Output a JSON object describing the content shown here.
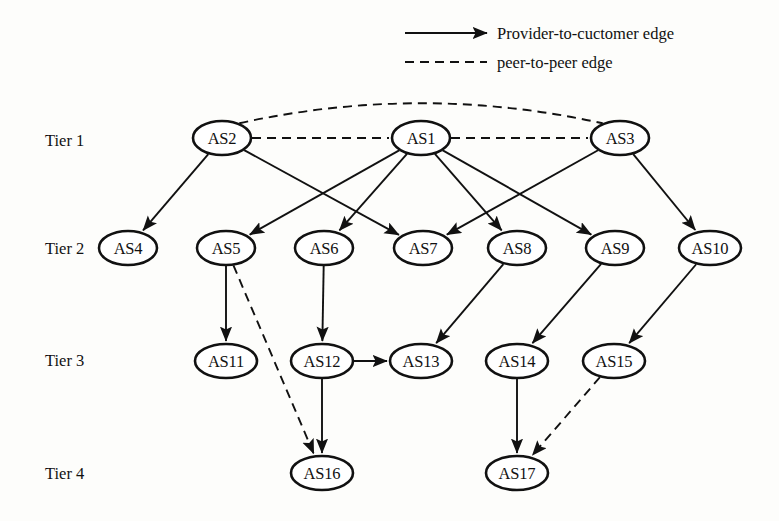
{
  "figure": {
    "kind": "as-hierarchy-diagram",
    "width": 779,
    "height": 521,
    "background_color": "#fdfdfb",
    "ink_color": "#111111"
  },
  "legend": {
    "items": [
      {
        "id": "legend-provider",
        "label": "Provider-to-cuctomer edge",
        "style": "solid-arrow"
      },
      {
        "id": "legend-peer",
        "label": "peer-to-peer edge",
        "style": "dashed"
      }
    ]
  },
  "tiers": [
    {
      "id": "tier-1",
      "label": "Tier 1",
      "x": 45,
      "y": 140
    },
    {
      "id": "tier-2",
      "label": "Tier 2",
      "x": 45,
      "y": 248
    },
    {
      "id": "tier-3",
      "label": "Tier 3",
      "x": 45,
      "y": 360
    },
    {
      "id": "tier-4",
      "label": "Tier 4",
      "x": 45,
      "y": 473
    }
  ],
  "nodes": [
    {
      "id": "AS2",
      "label": "AS2",
      "tier": 1,
      "x": 222,
      "y": 138,
      "rx": 29,
      "ry": 17
    },
    {
      "id": "AS1",
      "label": "AS1",
      "tier": 1,
      "x": 421,
      "y": 138,
      "rx": 29,
      "ry": 17
    },
    {
      "id": "AS3",
      "label": "AS3",
      "tier": 1,
      "x": 620,
      "y": 138,
      "rx": 29,
      "ry": 17
    },
    {
      "id": "AS4",
      "label": "AS4",
      "tier": 2,
      "x": 128,
      "y": 248,
      "rx": 29,
      "ry": 17
    },
    {
      "id": "AS5",
      "label": "AS5",
      "tier": 2,
      "x": 226,
      "y": 248,
      "rx": 29,
      "ry": 17
    },
    {
      "id": "AS6",
      "label": "AS6",
      "tier": 2,
      "x": 324,
      "y": 248,
      "rx": 29,
      "ry": 17
    },
    {
      "id": "AS7",
      "label": "AS7",
      "tier": 2,
      "x": 423,
      "y": 248,
      "rx": 29,
      "ry": 17
    },
    {
      "id": "AS8",
      "label": "AS8",
      "tier": 2,
      "x": 517,
      "y": 248,
      "rx": 29,
      "ry": 17
    },
    {
      "id": "AS9",
      "label": "AS9",
      "tier": 2,
      "x": 615,
      "y": 248,
      "rx": 29,
      "ry": 17
    },
    {
      "id": "AS10",
      "label": "AS10",
      "tier": 2,
      "x": 710,
      "y": 248,
      "rx": 31,
      "ry": 17
    },
    {
      "id": "AS11",
      "label": "AS11",
      "tier": 3,
      "x": 226,
      "y": 361,
      "rx": 31,
      "ry": 17
    },
    {
      "id": "AS12",
      "label": "AS12",
      "tier": 3,
      "x": 322,
      "y": 361,
      "rx": 31,
      "ry": 17
    },
    {
      "id": "AS13",
      "label": "AS13",
      "tier": 3,
      "x": 421,
      "y": 361,
      "rx": 31,
      "ry": 17
    },
    {
      "id": "AS14",
      "label": "AS14",
      "tier": 3,
      "x": 517,
      "y": 361,
      "rx": 31,
      "ry": 17
    },
    {
      "id": "AS15",
      "label": "AS15",
      "tier": 3,
      "x": 614,
      "y": 361,
      "rx": 31,
      "ry": 17
    },
    {
      "id": "AS16",
      "label": "AS16",
      "tier": 4,
      "x": 322,
      "y": 473,
      "rx": 31,
      "ry": 17
    },
    {
      "id": "AS17",
      "label": "AS17",
      "tier": 4,
      "x": 517,
      "y": 473,
      "rx": 31,
      "ry": 17
    }
  ],
  "edges": [
    {
      "id": "AS2-AS3",
      "from": "AS2",
      "to": "AS3",
      "type": "peer",
      "shape": "arc",
      "arc_apex_y": 104
    },
    {
      "id": "AS2-AS1",
      "from": "AS2",
      "to": "AS1",
      "type": "peer",
      "shape": "straight"
    },
    {
      "id": "AS1-AS3",
      "from": "AS1",
      "to": "AS3",
      "type": "peer",
      "shape": "straight"
    },
    {
      "id": "AS2-AS4",
      "from": "AS2",
      "to": "AS4",
      "type": "provider",
      "shape": "straight"
    },
    {
      "id": "AS2-AS7",
      "from": "AS2",
      "to": "AS7",
      "type": "provider",
      "shape": "straight"
    },
    {
      "id": "AS1-AS5",
      "from": "AS1",
      "to": "AS5",
      "type": "provider",
      "shape": "straight"
    },
    {
      "id": "AS1-AS6",
      "from": "AS1",
      "to": "AS6",
      "type": "provider",
      "shape": "straight"
    },
    {
      "id": "AS1-AS8",
      "from": "AS1",
      "to": "AS8",
      "type": "provider",
      "shape": "straight"
    },
    {
      "id": "AS1-AS9",
      "from": "AS1",
      "to": "AS9",
      "type": "provider",
      "shape": "straight"
    },
    {
      "id": "AS3-AS7",
      "from": "AS3",
      "to": "AS7",
      "type": "provider",
      "shape": "straight"
    },
    {
      "id": "AS3-AS10",
      "from": "AS3",
      "to": "AS10",
      "type": "provider",
      "shape": "straight"
    },
    {
      "id": "AS5-AS11",
      "from": "AS5",
      "to": "AS11",
      "type": "provider",
      "shape": "straight"
    },
    {
      "id": "AS5-AS16",
      "from": "AS5",
      "to": "AS16",
      "type": "peer",
      "shape": "straight"
    },
    {
      "id": "AS6-AS12",
      "from": "AS6",
      "to": "AS12",
      "type": "provider",
      "shape": "straight"
    },
    {
      "id": "AS8-AS13",
      "from": "AS8",
      "to": "AS13",
      "type": "provider",
      "shape": "straight"
    },
    {
      "id": "AS9-AS14",
      "from": "AS9",
      "to": "AS14",
      "type": "provider",
      "shape": "straight"
    },
    {
      "id": "AS10-AS15",
      "from": "AS10",
      "to": "AS15",
      "type": "provider",
      "shape": "straight"
    },
    {
      "id": "AS12-AS13",
      "from": "AS12",
      "to": "AS13",
      "type": "provider",
      "shape": "straight"
    },
    {
      "id": "AS12-AS16",
      "from": "AS12",
      "to": "AS16",
      "type": "provider",
      "shape": "straight"
    },
    {
      "id": "AS14-AS17",
      "from": "AS14",
      "to": "AS17",
      "type": "provider",
      "shape": "straight"
    },
    {
      "id": "AS15-AS17",
      "from": "AS15",
      "to": "AS17",
      "type": "peer",
      "shape": "straight"
    }
  ],
  "legend_geometry": {
    "solid": {
      "x1": 405,
      "x2": 487,
      "y": 33,
      "label_x": 497,
      "label_y": 33
    },
    "dashed": {
      "x1": 405,
      "x2": 487,
      "y": 62,
      "label_x": 497,
      "label_y": 62
    }
  }
}
